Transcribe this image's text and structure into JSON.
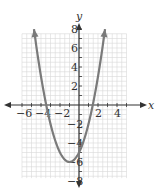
{
  "chart_data": {
    "type": "line",
    "title": "",
    "xlabel": "x",
    "ylabel": "y",
    "xlim": [
      -6,
      5
    ],
    "ylim": [
      -8,
      8
    ],
    "grid": true,
    "x_tick_labels": [
      "-6",
      "-4",
      "-2",
      "2",
      "4"
    ],
    "y_tick_labels": [
      "8",
      "6",
      "4",
      "2",
      "-2",
      "-4",
      "-6",
      "-8"
    ],
    "series": [
      {
        "name": "parabola",
        "equation": "y = x^2 + 2x - 5",
        "vertex": [
          -1,
          -6
        ],
        "x_intercepts": [
          -3.45,
          1.45
        ],
        "y_intercept": -5,
        "x": [
          -4.74,
          -4,
          -3,
          -2,
          -1,
          0,
          1,
          2,
          2.74
        ],
        "y": [
          8,
          3,
          -2,
          -5,
          -6,
          -5,
          -2,
          3,
          8
        ],
        "arrows_at_ends": true
      }
    ],
    "colors": {
      "curve": "#7a7a7a",
      "axes": "#333333",
      "grid": "#d9d9d9"
    }
  }
}
